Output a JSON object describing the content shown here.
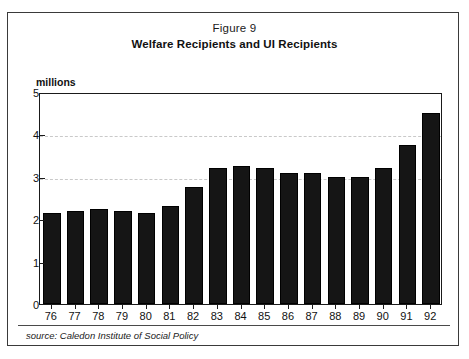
{
  "figure": {
    "label": "Figure 9",
    "title": "Welfare Recipients and UI Recipients",
    "source_note": "source: Caledon Institute of Social Policy"
  },
  "chart_data": {
    "type": "bar",
    "title": "Welfare Recipients and UI Recipients",
    "subtitle": "Figure 9",
    "xlabel": "",
    "ylabel": "millions",
    "units_caption": "millions",
    "categories": [
      "76",
      "77",
      "78",
      "79",
      "80",
      "81",
      "82",
      "83",
      "84",
      "85",
      "86",
      "87",
      "88",
      "89",
      "90",
      "91",
      "92"
    ],
    "values": [
      2.15,
      2.2,
      2.25,
      2.2,
      2.15,
      2.3,
      2.75,
      3.2,
      3.25,
      3.2,
      3.1,
      3.1,
      3.0,
      3.0,
      3.2,
      3.75,
      4.5
    ],
    "ylim": [
      0,
      5
    ],
    "ytick_values": [
      0,
      1,
      2,
      3,
      4,
      5
    ],
    "ytick_labels": [
      "0",
      "1",
      "2",
      "3",
      "4",
      "5"
    ],
    "gridlines_at": [
      3,
      4
    ],
    "grid": true,
    "legend": "none",
    "bar_color": "#151515",
    "grid_color": "#c9c9c9",
    "axis_color": "#1a1a1a"
  }
}
